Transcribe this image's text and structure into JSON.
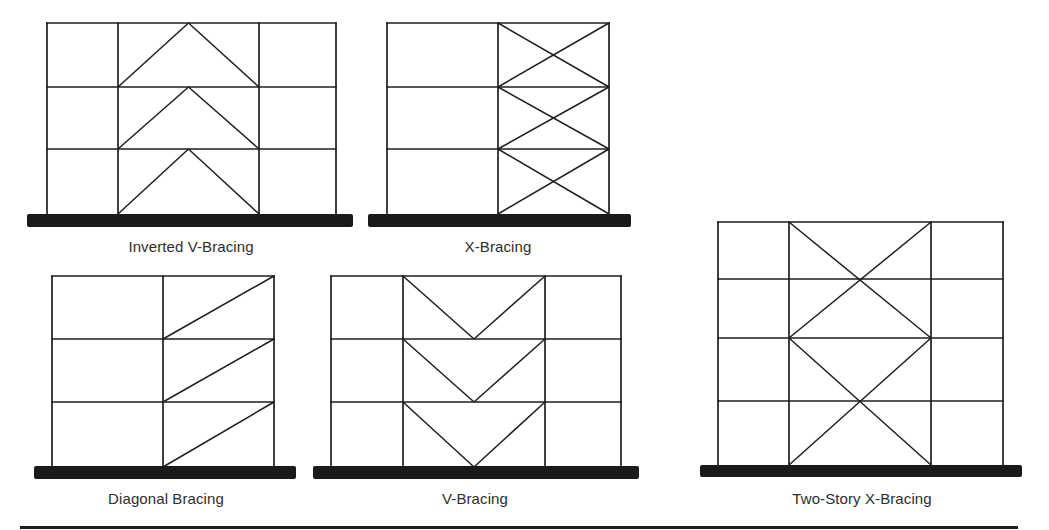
{
  "diagram": {
    "colors": {
      "line": "#1e1e1e",
      "base": "#1a1a1a",
      "label": "#2e2e2e",
      "background": "#ffffff"
    },
    "frames": [
      {
        "id": "inverted-v-bracing",
        "label": "Inverted V-Bracing",
        "label_pos": [
          191,
          238
        ],
        "columns": [
          47,
          118,
          259,
          336
        ],
        "floors": [
          23,
          87,
          149,
          214
        ],
        "base": {
          "x1": 27,
          "x2": 353,
          "y": 214,
          "h": 13
        },
        "braced_bay": [
          1
        ],
        "brace_type": "inverted-v"
      },
      {
        "id": "x-bracing",
        "label": "X-Bracing",
        "label_pos": [
          498,
          238
        ],
        "columns": [
          387,
          498,
          609
        ],
        "floors": [
          23,
          87,
          149,
          214
        ],
        "base": {
          "x1": 368,
          "x2": 631,
          "y": 214,
          "h": 13
        },
        "braced_bay": [
          1
        ],
        "brace_type": "x"
      },
      {
        "id": "diagonal-bracing",
        "label": "Diagonal Bracing",
        "label_pos": [
          166,
          490
        ],
        "columns": [
          52,
          163,
          274
        ],
        "floors": [
          276,
          339,
          402,
          467
        ],
        "base": {
          "x1": 34,
          "x2": 296,
          "y": 466,
          "h": 13
        },
        "braced_bay": [
          1
        ],
        "brace_type": "diagonal"
      },
      {
        "id": "v-bracing",
        "label": "V-Bracing",
        "label_pos": [
          475,
          490
        ],
        "columns": [
          331,
          403,
          545,
          621
        ],
        "floors": [
          276,
          339,
          402,
          467
        ],
        "base": {
          "x1": 313,
          "x2": 639,
          "y": 466,
          "h": 13
        },
        "braced_bay": [
          1
        ],
        "brace_type": "v"
      },
      {
        "id": "two-story-x-bracing",
        "label": "Two-Story X-Bracing",
        "label_pos": [
          862,
          490
        ],
        "columns": [
          718,
          789,
          931,
          1003
        ],
        "floors": [
          222,
          279,
          338,
          401,
          465
        ],
        "base": {
          "x1": 700,
          "x2": 1022,
          "y": 465,
          "h": 12
        },
        "braced_bay": [
          1
        ],
        "brace_type": "two-story-x"
      }
    ]
  }
}
